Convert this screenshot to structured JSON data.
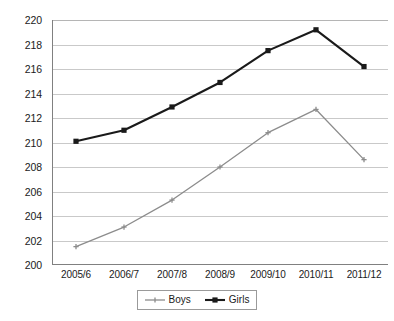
{
  "chart_data": {
    "type": "line",
    "title": "",
    "subtitle": "",
    "xlabel": "",
    "ylabel": "",
    "categories": [
      "2005/6",
      "2006/7",
      "2007/8",
      "2008/9",
      "2009/10",
      "2010/11",
      "2011/12"
    ],
    "series": [
      {
        "name": "Boys",
        "color": "#8c8c8c",
        "marker": "plus",
        "values": [
          201.5,
          203.1,
          205.3,
          208.0,
          210.8,
          212.7,
          208.6
        ]
      },
      {
        "name": "Girls",
        "color": "#1a1a1a",
        "marker": "square",
        "values": [
          210.1,
          211.0,
          212.9,
          214.9,
          217.5,
          219.2,
          216.2
        ]
      }
    ],
    "ylim": [
      200,
      220
    ],
    "yticks": [
      200,
      202,
      204,
      206,
      208,
      210,
      212,
      214,
      216,
      218,
      220
    ],
    "ytick_labels": [
      "200",
      "202",
      "204",
      "206",
      "208",
      "210",
      "212",
      "214",
      "216",
      "218",
      "220"
    ],
    "grid": true,
    "grid_axis": "y",
    "legend_position": "bottom-center",
    "legend_entries": [
      {
        "label": "Boys",
        "color": "#8c8c8c",
        "marker": "plus"
      },
      {
        "label": "Girls",
        "color": "#1a1a1a",
        "marker": "square"
      }
    ],
    "background_color": "#ffffff",
    "axis_color": "#808080",
    "gridline_color": "#c9c9c9"
  }
}
